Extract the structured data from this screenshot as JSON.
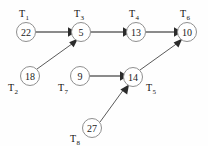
{
  "diagram": {
    "background_color": "#fefefe",
    "node_stroke_color": "#8f8f8f",
    "edge_color": "#6e6e6e",
    "arrow_color": "#2b2b2b",
    "nodes": [
      {
        "id": "T1",
        "label": "T",
        "sub": "1",
        "value": "22",
        "cx": 26,
        "cy": 32,
        "r": 9.5,
        "label_x": 26,
        "label_y": 14
      },
      {
        "id": "T3",
        "label": "T",
        "sub": "3",
        "value": "5",
        "cx": 81,
        "cy": 32,
        "r": 9.5,
        "label_x": 81,
        "label_y": 14
      },
      {
        "id": "T4",
        "label": "T",
        "sub": "4",
        "value": "13",
        "cx": 136,
        "cy": 32,
        "r": 9.5,
        "label_x": 136,
        "label_y": 14
      },
      {
        "id": "T6",
        "label": "T",
        "sub": "6",
        "value": "10",
        "cx": 187,
        "cy": 32,
        "r": 9.5,
        "label_x": 187,
        "label_y": 14
      },
      {
        "id": "T2",
        "label": "T",
        "sub": "2",
        "value": "18",
        "cx": 30,
        "cy": 76,
        "r": 9.5,
        "label_x": 14,
        "label_y": 92
      },
      {
        "id": "T7",
        "label": "T",
        "sub": "7",
        "value": "9",
        "cx": 80,
        "cy": 76,
        "r": 9.5,
        "label_x": 64,
        "label_y": 92
      },
      {
        "id": "T5",
        "label": "T",
        "sub": "5",
        "value": "14",
        "cx": 133,
        "cy": 77,
        "r": 9.5,
        "label_x": 152,
        "label_y": 91
      },
      {
        "id": "T8",
        "label": "T",
        "sub": "8",
        "value": "27",
        "cx": 92,
        "cy": 128,
        "r": 9.5,
        "label_x": 76,
        "label_y": 142
      }
    ],
    "edges": [
      {
        "id": "e-T1-T3",
        "from": "T1",
        "to": "T3",
        "style": "solid",
        "x1": 36,
        "y1": 32,
        "x2": 70,
        "y2": 32
      },
      {
        "id": "e-T3-T4",
        "from": "T3",
        "to": "T4",
        "style": "solid",
        "x1": 91,
        "y1": 32,
        "x2": 125,
        "y2": 32
      },
      {
        "id": "e-T4-T6",
        "from": "T4",
        "to": "T6",
        "style": "solid",
        "x1": 146,
        "y1": 32,
        "x2": 176,
        "y2": 32
      },
      {
        "id": "e-T2-T3",
        "from": "T2",
        "to": "T3",
        "style": "thin",
        "x1": 38,
        "y1": 69,
        "x2": 75,
        "y2": 41
      },
      {
        "id": "e-T7-T5",
        "from": "T7",
        "to": "T5",
        "style": "solid",
        "x1": 90,
        "y1": 76,
        "x2": 122,
        "y2": 76
      },
      {
        "id": "e-T5-T6",
        "from": "T5",
        "to": "T6",
        "style": "thin",
        "x1": 141,
        "y1": 70,
        "x2": 180,
        "y2": 41
      },
      {
        "id": "e-T8-T5",
        "from": "T8",
        "to": "T5",
        "style": "thin",
        "x1": 100,
        "y1": 122,
        "x2": 127,
        "y2": 86
      }
    ]
  }
}
